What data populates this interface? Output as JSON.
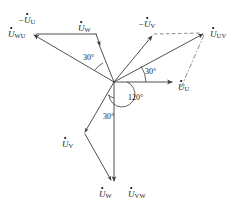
{
  "figure": {
    "kind": "phasor-diagram",
    "origin": {
      "x": 114,
      "y": 82
    },
    "stroke_color": "#3d3d3d",
    "dash_color": "#6e6e6e",
    "background": "#ffffff"
  },
  "labels": {
    "phase_u": {
      "text": "U",
      "sub": "U",
      "neg": false,
      "x": 178,
      "y": 83
    },
    "phase_v": {
      "text": "U",
      "sub": "V",
      "neg": false,
      "x": 62,
      "y": 140
    },
    "phase_w": {
      "text": "U",
      "sub": "W",
      "neg": false,
      "x": 78,
      "y": 24
    },
    "phase_w_bottom": {
      "text": "U",
      "sub": "W",
      "neg": false,
      "x": 99,
      "y": 190
    },
    "neg_u": {
      "text": "U",
      "sub": "U",
      "neg": true,
      "x": 18,
      "y": 16
    },
    "neg_v": {
      "text": "U",
      "sub": "V",
      "neg": true,
      "x": 138,
      "y": 20
    },
    "line_uv": {
      "text": "U",
      "sub": "UV",
      "neg": false,
      "x": 210,
      "y": 30
    },
    "line_vw": {
      "text": "U",
      "sub": "VW",
      "neg": false,
      "x": 128,
      "y": 190
    },
    "line_wu": {
      "text": "U",
      "sub": "WU",
      "neg": false,
      "x": 8,
      "y": 30
    }
  },
  "angles": {
    "upper_left_30": {
      "value": "30°",
      "x": 83,
      "y": 54
    },
    "right_30": {
      "value": "30°",
      "x": 145,
      "y": 68
    },
    "center_120": {
      "value": "120°",
      "x": 128,
      "y": 94
    },
    "lower_30": {
      "value": "30°",
      "x": 103,
      "y": 113
    }
  },
  "vectors": {
    "phase_u": {
      "name": "U-phase voltage",
      "from": [
        114,
        82
      ],
      "to": [
        174,
        82
      ],
      "style": "solid"
    },
    "phase_v": {
      "name": "V-phase voltage",
      "from": [
        114,
        82
      ],
      "to": [
        84,
        134
      ],
      "style": "solid"
    },
    "phase_w": {
      "name": "W-phase voltage",
      "from": [
        114,
        82
      ],
      "to": [
        97,
        40
      ],
      "style": "solid"
    },
    "neg_u": {
      "name": "negative U-phase voltage",
      "from": [
        114,
        82
      ],
      "to": [
        32,
        34
      ],
      "style": "solid"
    },
    "neg_v": {
      "name": "negative V-phase voltage",
      "from": [
        114,
        82
      ],
      "to": [
        152,
        34
      ],
      "style": "solid"
    },
    "line_uv": {
      "name": "UV line voltage",
      "from": [
        114,
        82
      ],
      "to": [
        205,
        33
      ],
      "style": "solid"
    },
    "line_vw": {
      "name": "VW line voltage",
      "from": [
        114,
        82
      ],
      "to": [
        114,
        184
      ],
      "style": "solid"
    },
    "line_wu": {
      "name": "WU line voltage",
      "from": [
        114,
        82
      ],
      "to": [
        32,
        34
      ],
      "style": "solid"
    },
    "constr_w_top": {
      "name": "W top construction segment",
      "from": [
        32,
        34
      ],
      "to": [
        97,
        34
      ],
      "style": "solid"
    },
    "constr_w_arrow": {
      "name": "W top to phase W arrow",
      "from": [
        97,
        34
      ],
      "to": [
        100,
        44
      ],
      "style": "solid"
    },
    "constr_v_bottom": {
      "name": "V bottom construction segment",
      "from": [
        84,
        134
      ],
      "to": [
        112,
        182
      ],
      "style": "solid"
    },
    "dash_uv_top": {
      "name": "UV top dashed closure",
      "from": [
        152,
        34
      ],
      "to": [
        205,
        33
      ],
      "style": "dashed"
    },
    "dash_uv_side": {
      "name": "UV side dashdot closure",
      "from": [
        205,
        33
      ],
      "to": [
        178,
        92
      ],
      "style": "dashdot"
    }
  },
  "meta": {
    "canvas_width": 242,
    "canvas_height": 215
  }
}
